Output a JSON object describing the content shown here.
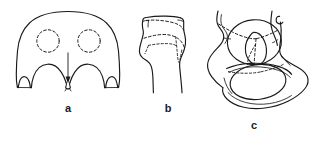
{
  "figure": {
    "background_color": "#ffffff",
    "ink_color": "#1a1a1a",
    "width": 327,
    "height": 145,
    "panels": [
      {
        "id": "a",
        "label": "a",
        "caption_position": {
          "x": 68,
          "y": 108
        },
        "subject": "sacrum-anterior-view",
        "description": "Rounded bone outline with two dashed circular foramina and a downward arrow indicating a central inferior notch",
        "features": [
          {
            "name": "outer-contour",
            "style": "solid"
          },
          {
            "name": "left-dashed-foramen",
            "style": "dashed",
            "center": [
              48,
              41
            ],
            "radius": 11
          },
          {
            "name": "right-dashed-foramen",
            "style": "dashed",
            "center": [
              89,
              41
            ],
            "radius": 11
          },
          {
            "name": "down-arrow-indicator",
            "style": "solid",
            "from": [
              68,
              53
            ],
            "to": [
              68,
              80
            ]
          },
          {
            "name": "central-inferior-notch",
            "style": "solid"
          }
        ]
      },
      {
        "id": "b",
        "label": "b",
        "caption_position": {
          "x": 168,
          "y": 108
        },
        "subject": "proximal-tibia-lateral-view",
        "description": "Proximal tibia head tapering into the shaft with dashed fracture lines outlining a depressed plateau fragment",
        "features": [
          {
            "name": "bone-outline",
            "style": "solid"
          },
          {
            "name": "plateau-fracture-line",
            "style": "dashed"
          },
          {
            "name": "lateral-fragment-outline",
            "style": "dashed"
          }
        ]
      },
      {
        "id": "c",
        "label": "c",
        "caption_position": {
          "x": 254,
          "y": 125
        },
        "subject": "pelvis-acetabulum-oblique-view",
        "description": "Hemipelvis with acetabulum and obturator foramen; dashed lines mark the fracture course across the acetabular columns",
        "features": [
          {
            "name": "pelvic-outline",
            "style": "solid"
          },
          {
            "name": "acetabulum-ring",
            "style": "solid"
          },
          {
            "name": "obturator-foramen",
            "style": "solid"
          },
          {
            "name": "femoral-head-outline",
            "style": "solid"
          },
          {
            "name": "anterior-column-fracture-line",
            "style": "dashed"
          },
          {
            "name": "posterior-column-fracture-line",
            "style": "dashed"
          }
        ]
      }
    ]
  }
}
